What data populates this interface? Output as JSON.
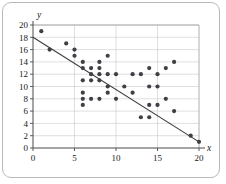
{
  "figure": {
    "kind": "scatter-plot-with-trend-line",
    "background_color": "#ffffff",
    "border_color": "#b9b9b9",
    "point_color": "#3f3f46",
    "line_color": "#3b3b3b",
    "grid_color": "#c9c9c9",
    "axis_color": "#4a4a4a"
  },
  "chart_data": {
    "type": "scatter",
    "title": "",
    "xlabel": "x",
    "ylabel": "y",
    "xlim": [
      0,
      20
    ],
    "ylim": [
      0,
      20
    ],
    "grid": true,
    "legend": "none",
    "xticks": [
      0,
      5,
      10,
      15,
      20
    ],
    "yticks": [
      0,
      2,
      4,
      6,
      8,
      10,
      12,
      14,
      16,
      18,
      20
    ],
    "xtick_labels": [
      "0",
      "5",
      "10",
      "15",
      "20"
    ],
    "ytick_labels": [
      "0",
      "2",
      "4",
      "6",
      "8",
      "10",
      "12",
      "14",
      "16",
      "18",
      "20"
    ],
    "points": [
      [
        1,
        19
      ],
      [
        2,
        16
      ],
      [
        4,
        17
      ],
      [
        5,
        16
      ],
      [
        5,
        15
      ],
      [
        6,
        14
      ],
      [
        6,
        13
      ],
      [
        6,
        11
      ],
      [
        6,
        9
      ],
      [
        6,
        8
      ],
      [
        6,
        7
      ],
      [
        7,
        13
      ],
      [
        7,
        12
      ],
      [
        7,
        11
      ],
      [
        7,
        8
      ],
      [
        8,
        14
      ],
      [
        8,
        13
      ],
      [
        8,
        12
      ],
      [
        8,
        11
      ],
      [
        8,
        8
      ],
      [
        9,
        15
      ],
      [
        9,
        12
      ],
      [
        9,
        10
      ],
      [
        9,
        9
      ],
      [
        10,
        12
      ],
      [
        10,
        8
      ],
      [
        11,
        10
      ],
      [
        12,
        12
      ],
      [
        12,
        9
      ],
      [
        13,
        12
      ],
      [
        13,
        5
      ],
      [
        14,
        13
      ],
      [
        14,
        10
      ],
      [
        14,
        7
      ],
      [
        14,
        5
      ],
      [
        15,
        12
      ],
      [
        15,
        10
      ],
      [
        15,
        7
      ],
      [
        16,
        13
      ],
      [
        16,
        8
      ],
      [
        17,
        14
      ],
      [
        17,
        6
      ],
      [
        19,
        2
      ],
      [
        20,
        1
      ]
    ],
    "trend_line": {
      "label": "line of best fit",
      "x_start": 0,
      "y_start": 18,
      "x_end": 20,
      "y_end": 1
    }
  }
}
